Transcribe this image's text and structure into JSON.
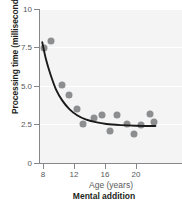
{
  "chart_data": {
    "type": "scatter",
    "title": "",
    "caption": "Mental addition",
    "xlabel": "Age (years)",
    "ylabel": "Processing time (milliseconds)",
    "xlim": [
      7.2,
      22.6
    ],
    "ylim": [
      0,
      10
    ],
    "xticks": [
      8,
      12,
      16,
      20
    ],
    "xticklabels": [
      "8",
      "12",
      "16",
      "20"
    ],
    "yticks": [
      0,
      2.5,
      5.0,
      7.5,
      10
    ],
    "yticklabels": [
      "0",
      "2.5",
      "5.0",
      "7.5",
      "10"
    ],
    "grid": "horizontal-white-on-gray",
    "legend": "none",
    "point_color": "#8d8e90",
    "curve_color": "#1a1a1a",
    "plot_background": "#f4f4f4",
    "axis_color": "#86878a",
    "points": [
      {
        "x": 8.1,
        "y": 7.5
      },
      {
        "x": 9.0,
        "y": 7.9
      },
      {
        "x": 10.5,
        "y": 5.05
      },
      {
        "x": 11.4,
        "y": 4.4
      },
      {
        "x": 12.4,
        "y": 3.5
      },
      {
        "x": 13.1,
        "y": 2.55
      },
      {
        "x": 14.6,
        "y": 2.9
      },
      {
        "x": 15.6,
        "y": 3.1
      },
      {
        "x": 16.6,
        "y": 2.1
      },
      {
        "x": 17.6,
        "y": 3.1
      },
      {
        "x": 18.9,
        "y": 2.55
      },
      {
        "x": 19.7,
        "y": 1.9
      },
      {
        "x": 20.7,
        "y": 2.45
      },
      {
        "x": 21.8,
        "y": 3.15
      },
      {
        "x": 22.3,
        "y": 2.65
      }
    ],
    "fit_curve": {
      "description": "decaying exponential toward asymptote ~2.4 ms",
      "asymptote": 2.4,
      "points": [
        {
          "x": 7.9,
          "y": 7.85
        },
        {
          "x": 8.4,
          "y": 6.7
        },
        {
          "x": 9.0,
          "y": 5.7
        },
        {
          "x": 9.7,
          "y": 4.75
        },
        {
          "x": 10.5,
          "y": 4.05
        },
        {
          "x": 11.4,
          "y": 3.5
        },
        {
          "x": 12.4,
          "y": 3.1
        },
        {
          "x": 13.5,
          "y": 2.83
        },
        {
          "x": 14.8,
          "y": 2.65
        },
        {
          "x": 16.2,
          "y": 2.53
        },
        {
          "x": 18.0,
          "y": 2.46
        },
        {
          "x": 20.0,
          "y": 2.42
        },
        {
          "x": 22.5,
          "y": 2.4
        }
      ]
    }
  }
}
